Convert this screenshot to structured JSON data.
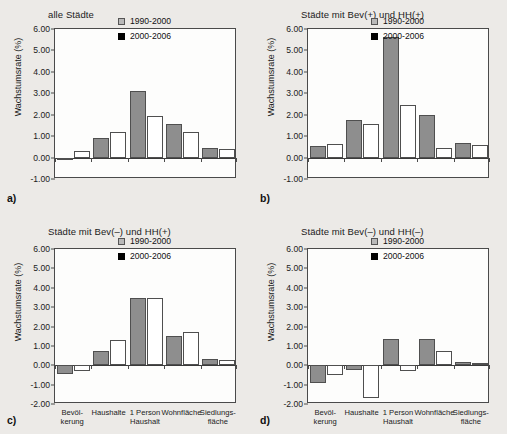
{
  "figure": {
    "background_color": "#eceae7",
    "series_colors": [
      "#8e8e8e",
      "#ffffff"
    ],
    "legend_swatch_colors": [
      "#b9b9b9",
      "#000000"
    ]
  },
  "legend": {
    "entries": [
      {
        "label": "1990-2000",
        "marker": "light-gray-square"
      },
      {
        "label": "2000-2006",
        "marker": "black-square"
      }
    ]
  },
  "axis": {
    "ylabel": "Wachstumsrate (%)",
    "yticks_top": [
      "6.00",
      "5.00",
      "4.00",
      "3.00",
      "2.00",
      "1.00",
      "0.00",
      "-1.00"
    ],
    "yticks_bottom": [
      "6.00",
      "5.00",
      "4.00",
      "3.00",
      "2.00",
      "1.00",
      "0.00",
      "-1.00",
      "-2.00"
    ],
    "categories": [
      "Bevöl-\nkerung",
      "Haushalte",
      "1 Person\nHaushalt",
      "Wohnfläche",
      "Siedlungs-\nfläche"
    ]
  },
  "panels": [
    {
      "key": "a",
      "letter": "a)",
      "title": "alle Städte"
    },
    {
      "key": "b",
      "letter": "b)",
      "title": "Städte mit Bev(+) und HH(+)"
    },
    {
      "key": "c",
      "letter": "c)",
      "title": "Städte mit Bev(–) und HH(+)"
    },
    {
      "key": "d",
      "letter": "d)",
      "title": "Städte mit Bev(–) und HH(–)"
    }
  ],
  "chart_data": [
    {
      "type": "bar",
      "panel": "a",
      "title": "alle Städte",
      "xlabel": "",
      "ylabel": "Wachstumsrate (%)",
      "ylim": [
        -1.0,
        6.0
      ],
      "ytick_step": 1.0,
      "grid": false,
      "legend_position": "top-right",
      "categories": [
        "Bevölkerung",
        "Haushalte",
        "1 Person Haushalt",
        "Wohnfläche",
        "Siedlungsfläche"
      ],
      "series": [
        {
          "name": "1990-2000",
          "values": [
            -0.08,
            0.93,
            3.12,
            1.58,
            0.46
          ]
        },
        {
          "name": "2000-2006",
          "values": [
            0.32,
            1.21,
            1.94,
            1.19,
            0.39
          ]
        }
      ]
    },
    {
      "type": "bar",
      "panel": "b",
      "title": "Städte mit Bev(+) und HH(+)",
      "xlabel": "",
      "ylabel": "Wachstumsrate (%)",
      "ylim": [
        -1.0,
        6.0
      ],
      "ytick_step": 1.0,
      "grid": false,
      "legend_position": "top-right",
      "categories": [
        "Bevölkerung",
        "Haushalte",
        "1 Person Haushalt",
        "Wohnfläche",
        "Siedlungsfläche"
      ],
      "series": [
        {
          "name": "1990-2000",
          "values": [
            0.53,
            1.75,
            5.65,
            1.97,
            0.7
          ]
        },
        {
          "name": "2000-2006",
          "values": [
            0.63,
            1.58,
            2.47,
            0.45,
            0.57
          ]
        }
      ]
    },
    {
      "type": "bar",
      "panel": "c",
      "title": "Städte mit Bev(–) und HH(+)",
      "xlabel": "",
      "ylabel": "Wachstumsrate (%)",
      "ylim": [
        -2.0,
        6.0
      ],
      "ytick_step": 1.0,
      "grid": false,
      "legend_position": "top-right",
      "categories": [
        "Bevölkerung",
        "Haushalte",
        "1 Person Haushalt",
        "Wohnfläche",
        "Siedlungsfläche"
      ],
      "series": [
        {
          "name": "1990-2000",
          "values": [
            -0.47,
            0.72,
            3.48,
            1.52,
            0.31
          ]
        },
        {
          "name": "2000-2006",
          "values": [
            -0.29,
            1.3,
            3.48,
            1.74,
            0.27
          ]
        }
      ]
    },
    {
      "type": "bar",
      "panel": "d",
      "title": "Städte mit Bev(–) und HH(–)",
      "xlabel": "",
      "ylabel": "Wachstumsrate (%)",
      "ylim": [
        -2.0,
        6.0
      ],
      "ytick_step": 1.0,
      "grid": false,
      "legend_position": "top-right",
      "categories": [
        "Bevölkerung",
        "Haushalte",
        "1 Person Haushalt",
        "Wohnfläche",
        "Siedlungsfläche"
      ],
      "series": [
        {
          "name": "1990-2000",
          "values": [
            -0.9,
            -0.25,
            1.33,
            1.35,
            0.16
          ]
        },
        {
          "name": "2000-2006",
          "values": [
            -0.5,
            -1.7,
            -0.3,
            0.72,
            0.11
          ]
        }
      ]
    }
  ]
}
